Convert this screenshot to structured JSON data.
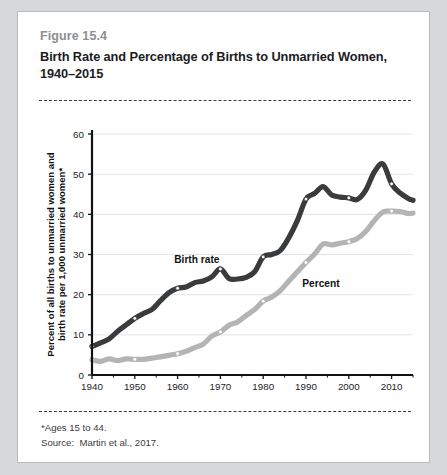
{
  "figure": {
    "number": "Figure 15.4",
    "title_line1": "Birth Rate and Percentage of Births to Unmarried Women,",
    "title_line2": "1940–2015"
  },
  "footnotes": {
    "asterisk": "*Ages 15 to 44.",
    "source": "Source:  Martin et al., 2017."
  },
  "colors": {
    "birth_rate": "#3a3b3d",
    "percent": "#b3b4b6",
    "axis": "#111214",
    "gridline": "#e3e4e6",
    "card_background": "#ffffff",
    "page_background": "#d7d8d9",
    "card_border": "#b9babb",
    "figure_number": "#8d8e90",
    "title": "#1c1d1f"
  },
  "chart_data": {
    "type": "line",
    "title": "Birth Rate and Percentage of Births to Unmarried Women, 1940–2015",
    "xlabel": "",
    "ylabel": "Percent of all births to unmarried women and birth rate per 1,000 unmarried women*",
    "ylabel_line1": "Percent of all births to unmarried women and",
    "ylabel_line2": "birth rate per 1,000 unmarried women*",
    "xlim": [
      1940,
      2015
    ],
    "ylim": [
      0,
      60
    ],
    "yticks": [
      0,
      10,
      20,
      30,
      40,
      50,
      60
    ],
    "xticks": [
      1940,
      1950,
      1960,
      1970,
      1980,
      1990,
      2000,
      2010
    ],
    "xminorticks": [
      1945,
      1955,
      1965,
      1975,
      1985,
      1995,
      2005,
      2015
    ],
    "grid": "horizontal",
    "legend": "inline-labels",
    "series": [
      {
        "name": "Birth rate",
        "label": "Birth rate",
        "color": "#3a3b3d",
        "label_position": {
          "x": 1964.5,
          "y": 28.0
        },
        "markers_at": [
          1940,
          1950,
          1960,
          1970,
          1980,
          1990,
          2000,
          2010
        ],
        "x": [
          1940,
          1942,
          1944,
          1946,
          1948,
          1950,
          1952,
          1954,
          1956,
          1958,
          1960,
          1962,
          1964,
          1966,
          1968,
          1970,
          1972,
          1974,
          1976,
          1978,
          1980,
          1982,
          1984,
          1986,
          1988,
          1990,
          1992,
          1994,
          1996,
          1998,
          2000,
          2002,
          2004,
          2006,
          2008,
          2010,
          2012,
          2014,
          2015
        ],
        "y": [
          7.1,
          8.0,
          9.0,
          10.9,
          12.5,
          14.1,
          15.3,
          16.3,
          18.5,
          20.5,
          21.6,
          21.9,
          23.0,
          23.4,
          24.4,
          26.4,
          24.0,
          23.9,
          24.3,
          25.7,
          29.4,
          30.0,
          31.0,
          34.2,
          38.5,
          43.8,
          45.2,
          46.9,
          44.8,
          44.3,
          44.1,
          43.7,
          46.1,
          50.6,
          52.5,
          47.6,
          45.3,
          43.9,
          43.5
        ]
      },
      {
        "name": "Percent",
        "label": "Percent",
        "color": "#b3b4b6",
        "label_position": {
          "x": 1993.5,
          "y": 22.0
        },
        "markers_at": [
          1940,
          1950,
          1960,
          1970,
          1980,
          1990,
          2000,
          2010
        ],
        "x": [
          1940,
          1942,
          1944,
          1946,
          1948,
          1950,
          1952,
          1954,
          1956,
          1958,
          1960,
          1962,
          1964,
          1966,
          1968,
          1970,
          1972,
          1974,
          1976,
          1978,
          1980,
          1982,
          1984,
          1986,
          1988,
          1990,
          1992,
          1994,
          1996,
          1998,
          2000,
          2002,
          2004,
          2006,
          2008,
          2010,
          2012,
          2014,
          2015
        ],
        "y": [
          3.8,
          3.4,
          4.0,
          3.6,
          4.0,
          3.9,
          3.9,
          4.2,
          4.5,
          4.9,
          5.3,
          5.9,
          6.8,
          7.7,
          9.7,
          10.7,
          12.4,
          13.2,
          14.8,
          16.3,
          18.4,
          19.4,
          21.0,
          23.4,
          25.7,
          28.0,
          30.1,
          32.6,
          32.4,
          32.8,
          33.2,
          34.0,
          35.8,
          38.5,
          40.6,
          40.8,
          40.7,
          40.2,
          40.3
        ]
      }
    ]
  }
}
